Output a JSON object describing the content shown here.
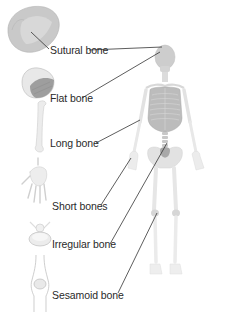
{
  "diagram": {
    "labels": [
      {
        "id": "sutural",
        "text": "Sutural bone",
        "x": 50,
        "y": 44
      },
      {
        "id": "flat",
        "text": "Flat bone",
        "x": 50,
        "y": 92
      },
      {
        "id": "long",
        "text": "Long bone",
        "x": 50,
        "y": 137
      },
      {
        "id": "short",
        "text": "Short bones",
        "x": 52,
        "y": 200
      },
      {
        "id": "irregular",
        "text": "Irregular bone",
        "x": 52,
        "y": 238
      },
      {
        "id": "sesamoid",
        "text": "Sesamoid bone",
        "x": 52,
        "y": 289
      }
    ],
    "colors": {
      "background": "#ffffff",
      "text": "#2a2a2a",
      "leader_line": "#333333",
      "bone_light": "#e4e4e4",
      "bone_mid": "#cfcfcf",
      "bone_dark": "#a9a9a9"
    }
  }
}
